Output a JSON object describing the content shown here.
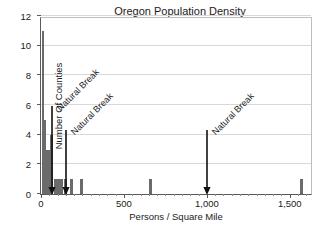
{
  "chart_data": {
    "type": "bar",
    "title": "Oregon Population Density By County",
    "title_lines": [
      "Oregon Population Density",
      "By County"
    ],
    "xlabel": "Persons / Square Mile",
    "ylabel": "Number Of Counties",
    "xlim": [
      0,
      1640
    ],
    "ylim": [
      0,
      12
    ],
    "grid": true,
    "legend": null,
    "xticks": [
      0,
      500,
      1000,
      1500
    ],
    "xticklabels": [
      "0",
      "500",
      "1,000",
      "1,500"
    ],
    "yticks": [
      0,
      2,
      4,
      6,
      8,
      10,
      12
    ],
    "yticklabels": [
      "0",
      "2",
      "4",
      "6",
      "8",
      "10",
      "12"
    ],
    "bar_color": "#6b6b6b",
    "bin_width": 25,
    "x": [
      5,
      20,
      35,
      50,
      65,
      85,
      105,
      125,
      150,
      185,
      245,
      660,
      1570
    ],
    "values": [
      11,
      5,
      3,
      3,
      4,
      1,
      1,
      1,
      1,
      1,
      1,
      1,
      1
    ],
    "annotations": [
      {
        "label": "Natural Break",
        "x": 65,
        "text_angle": -45
      },
      {
        "label": "Natural Break",
        "x": 150,
        "text_angle": -45
      },
      {
        "label": "Natural Break",
        "x": 1000,
        "text_angle": -45
      }
    ]
  },
  "axes": {
    "ylabel": "Number Of Counties",
    "xlabel": "Persons / Square Mile",
    "ytick_0": "0",
    "ytick_2": "2",
    "ytick_4": "4",
    "ytick_6": "6",
    "ytick_8": "8",
    "ytick_10": "10",
    "ytick_12": "12",
    "xtick_0": "0",
    "xtick_500": "500",
    "xtick_1000": "1,000",
    "xtick_1500": "1,500"
  },
  "title": {
    "line1": "Oregon Population Density",
    "line2": "By County"
  },
  "annotations": {
    "break1": "Natural Break",
    "break2": "Natural Break",
    "break3": "Natural Break"
  }
}
